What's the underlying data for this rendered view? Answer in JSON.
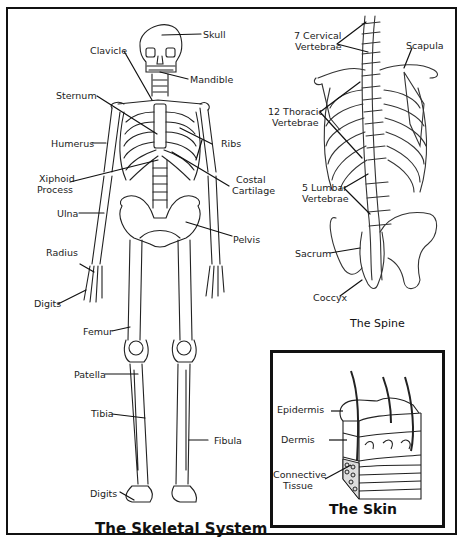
{
  "page": {
    "cut_caption": "The Skeletal System"
  },
  "skeleton": {
    "title": "The Skeletal System",
    "labels": {
      "skull": "Skull",
      "clavicle": "Clavicle",
      "mandible": "Mandible",
      "sternum": "Sternum",
      "ribs": "Ribs",
      "humerus": "Humerus",
      "xiphoid_1": "Xiphoid",
      "xiphoid_2": "Process",
      "costal_1": "Costal",
      "costal_2": "Cartilage",
      "ulna": "Ulna",
      "pelvis": "Pelvis",
      "radius": "Radius",
      "digits_hand": "Digits",
      "femur": "Femur",
      "patella": "Patella",
      "tibia": "Tibia",
      "fibula": "Fibula",
      "digits_foot": "Digits"
    }
  },
  "spine": {
    "title": "The Spine",
    "labels": {
      "cervical_1": "7 Cervical",
      "cervical_2": "Vertebrae",
      "scapula": "Scapula",
      "thoracic_1": "12 Thoracic",
      "thoracic_2": "Vertebrae",
      "lumbar_1": "5 Lumbar",
      "lumbar_2": "Vertebrae",
      "sacrum": "Sacrum",
      "coccyx": "Coccyx"
    }
  },
  "skin": {
    "title": "The Skin",
    "labels": {
      "epidermis": "Epidermis",
      "dermis": "Dermis",
      "connective_1": "Connective",
      "connective_2": "Tissue"
    }
  },
  "colors": {
    "ink": "#111111",
    "background": "#ffffff"
  }
}
